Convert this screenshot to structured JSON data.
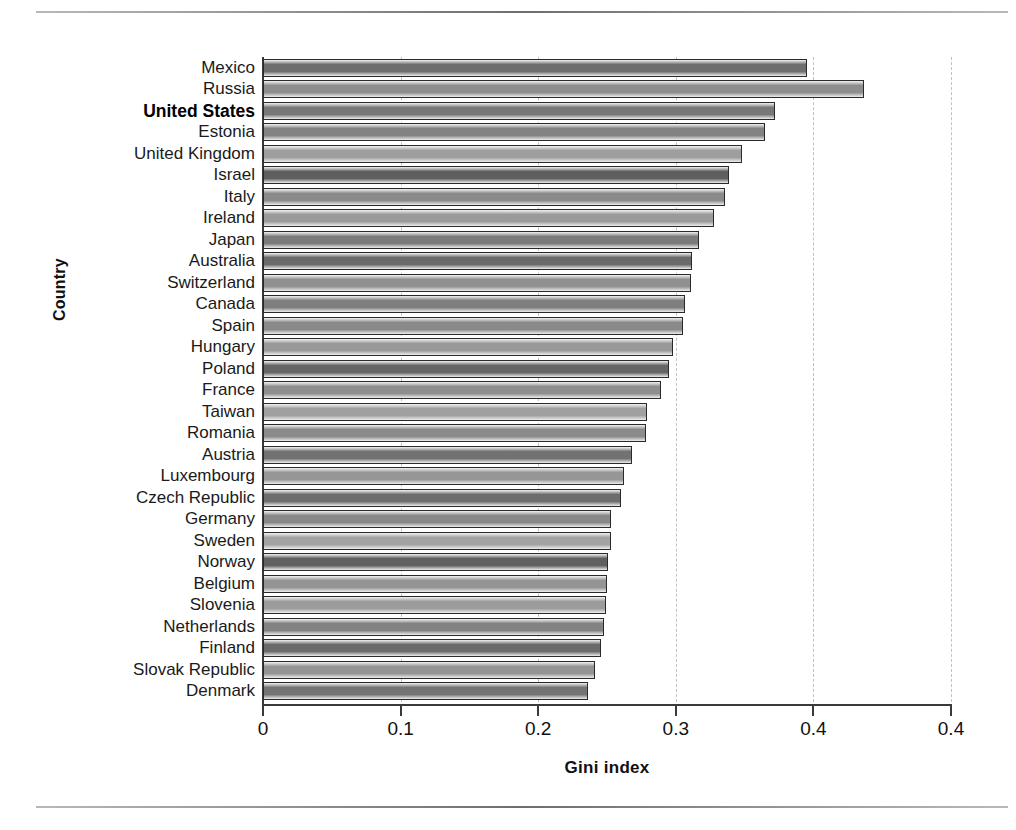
{
  "figure": {
    "ylabel": "Country",
    "xlabel": "Gini index",
    "highlight_country": "United States"
  },
  "chart_data": {
    "type": "bar",
    "orientation": "horizontal",
    "title": "",
    "xlabel": "Gini index",
    "ylabel": "Country",
    "xlim": [
      0,
      0.5
    ],
    "xticks": [
      0,
      0.1,
      0.2,
      0.3,
      0.4,
      0.5
    ],
    "xtick_labels": [
      "0",
      "0.1",
      "0.2",
      "0.3",
      "0.4",
      "0.4"
    ],
    "grid": "vertical dashed gridlines at each x tick",
    "legend": "none",
    "sorted": "descending by value",
    "categories": [
      "Mexico",
      "Russia",
      "United States",
      "Estonia",
      "United Kingdom",
      "Israel",
      "Italy",
      "Ireland",
      "Japan",
      "Australia",
      "Switzerland",
      "Canada",
      "Spain",
      "Hungary",
      "Poland",
      "France",
      "Taiwan",
      "Romania",
      "Austria",
      "Luxembourg",
      "Czech Republic",
      "Germany",
      "Sweden",
      "Norway",
      "Belgium",
      "Slovenia",
      "Netherlands",
      "Finland",
      "Slovak Republic",
      "Denmark"
    ],
    "values": [
      0.395,
      0.437,
      0.372,
      0.365,
      0.348,
      0.339,
      0.336,
      0.328,
      0.317,
      0.312,
      0.311,
      0.307,
      0.305,
      0.298,
      0.295,
      0.289,
      0.279,
      0.278,
      0.268,
      0.262,
      0.26,
      0.253,
      0.253,
      0.251,
      0.25,
      0.249,
      0.248,
      0.246,
      0.241,
      0.236
    ],
    "bar_shades": [
      "#6e6e6e",
      "#8d8d8d",
      "#787878",
      "#838383",
      "#9e9e9e",
      "#5f5f5f",
      "#8a8a8a",
      "#9a9a9a",
      "#7b7b7b",
      "#6a6a6a",
      "#909090",
      "#7f7f7f",
      "#898989",
      "#999999",
      "#656565",
      "#8e8e8e",
      "#a0a0a0",
      "#8b8b8b",
      "#727272",
      "#969696",
      "#6d6d6d",
      "#888888",
      "#a3a3a3",
      "#606060",
      "#949494",
      "#9c9c9c",
      "#828282",
      "#6b6b6b",
      "#939393",
      "#747474"
    ]
  }
}
